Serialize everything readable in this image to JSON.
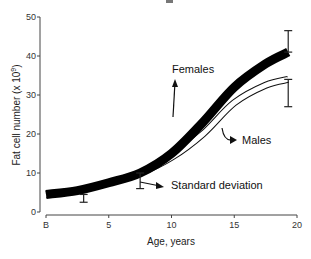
{
  "chart_data": {
    "type": "line",
    "title": "",
    "xlabel": "Age, years",
    "ylabel": "Fat cell number (x 10^9)",
    "ylabel_base": "Fat cell number (x 10",
    "ylabel_exp": "9",
    "ylabel_close": ")",
    "xlim": [
      0,
      20
    ],
    "ylim": [
      0,
      50
    ],
    "grid": false,
    "legend": "none (inline annotations)",
    "x_ticks": [
      {
        "value": 0,
        "label": "B"
      },
      {
        "value": 5,
        "label": "5"
      },
      {
        "value": 10,
        "label": "10"
      },
      {
        "value": 15,
        "label": "15"
      },
      {
        "value": 20,
        "label": "20"
      }
    ],
    "y_ticks": [
      {
        "value": 0,
        "label": "0"
      },
      {
        "value": 10,
        "label": "10"
      },
      {
        "value": 20,
        "label": "20"
      },
      {
        "value": 30,
        "label": "30"
      },
      {
        "value": 40,
        "label": "40"
      },
      {
        "value": 50,
        "label": "50"
      }
    ],
    "series": [
      {
        "name": "Females",
        "style": "thick black band",
        "x": [
          0,
          2.5,
          5,
          7.5,
          10,
          12.5,
          15,
          17.5,
          19.3
        ],
        "values": [
          4.5,
          5.5,
          7.5,
          10,
          15,
          23,
          32,
          38,
          41
        ]
      },
      {
        "name": "Males",
        "style": "outlined white band",
        "x": [
          0,
          2.5,
          5,
          7.5,
          10,
          12.5,
          15,
          17.5,
          19.3
        ],
        "values": [
          4.5,
          5.5,
          7.5,
          10,
          14,
          20,
          28,
          32.5,
          34
        ]
      }
    ],
    "error_bars": [
      {
        "x": 3,
        "low": 2.5,
        "high": 4.5,
        "note": "lower SD at ~3 years"
      },
      {
        "x": 7.5,
        "low": 6,
        "high": 10,
        "note": "lower SD at ~7.5 years"
      },
      {
        "x": 19.3,
        "series": "Females",
        "low": 41,
        "high": 46.5
      },
      {
        "x": 19.3,
        "series": "Males",
        "low": 27,
        "high": 34
      }
    ],
    "annotations": [
      {
        "text": "Females",
        "points_to": "Females band"
      },
      {
        "text": "Males",
        "points_to": "Males band"
      },
      {
        "text": "Standard deviation",
        "points_to": "error bar at ~7.5 years"
      }
    ]
  },
  "labels": {
    "females": "Females",
    "males": "Males",
    "sd": "Standard deviation"
  }
}
